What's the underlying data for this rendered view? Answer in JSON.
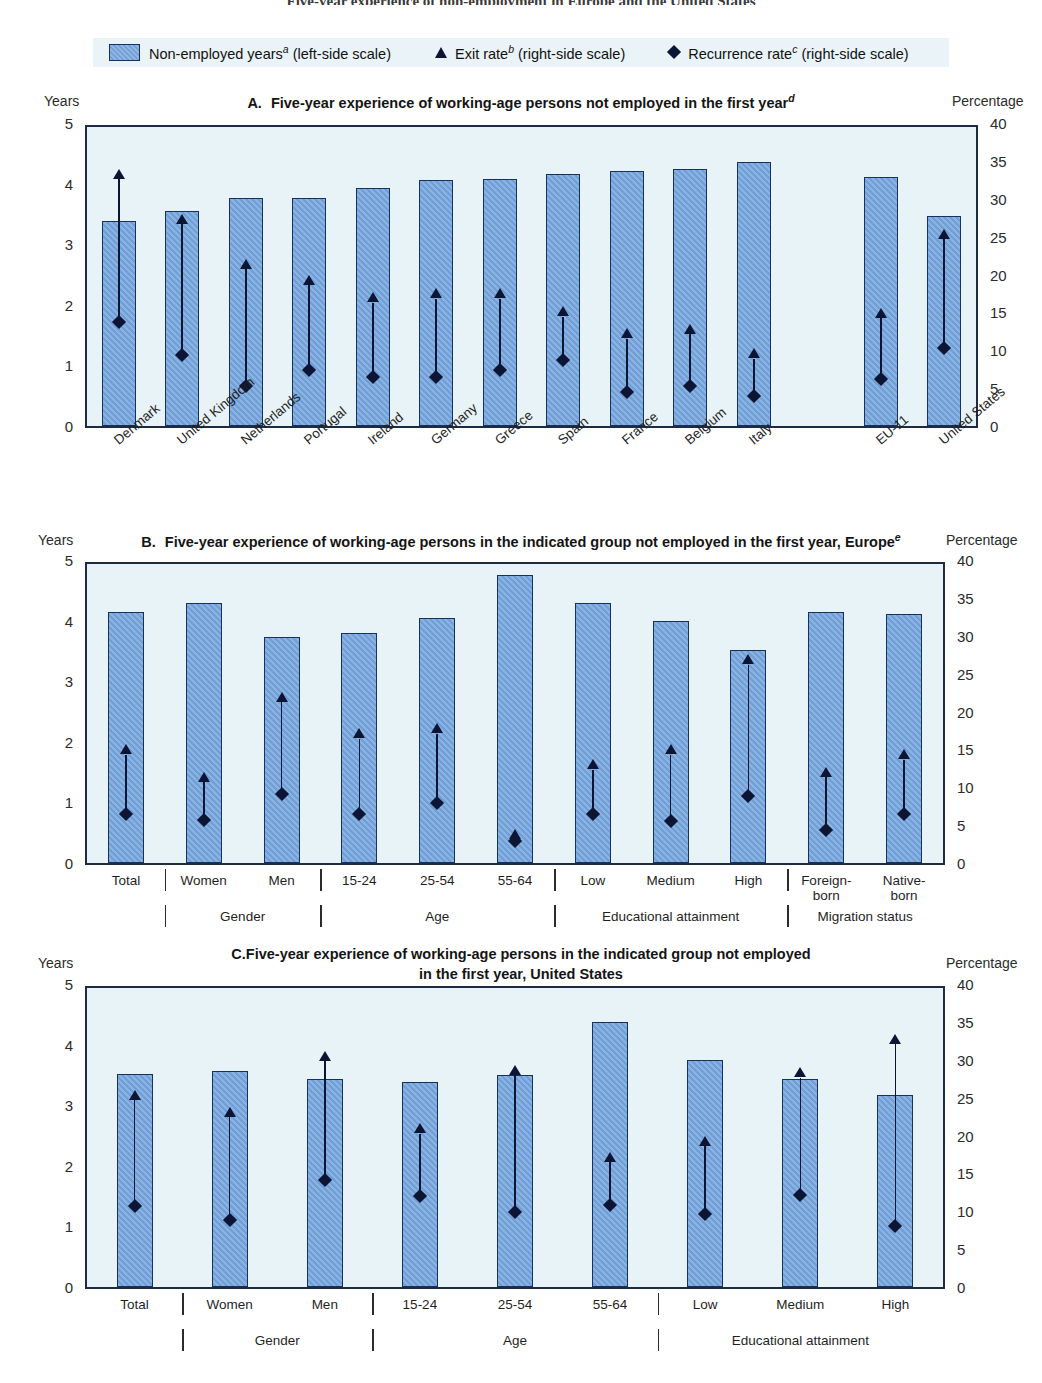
{
  "clipped_top_title": "Five-year experience of non-employment in Europe and the United States",
  "legend": {
    "bar": {
      "label_main": "Non-employed years",
      "sup": "a",
      "label_tail": " (left-side scale)",
      "icon": "bar-swatch"
    },
    "exit": {
      "label_main": "Exit rate",
      "sup": "b",
      "label_tail": " (right-side scale)",
      "icon": "triangle-marker"
    },
    "recurrence": {
      "label_main": "Recurrence rate",
      "sup": "c",
      "label_tail": " (right-side scale)",
      "icon": "diamond-marker"
    }
  },
  "axis": {
    "left_title": "Years",
    "right_title": "Percentage",
    "left_ticks": [
      "5",
      "4",
      "3",
      "2",
      "1",
      "0"
    ],
    "left_values": [
      5,
      4,
      3,
      2,
      1,
      0
    ],
    "right_ticks": [
      "40",
      "35",
      "30",
      "25",
      "20",
      "15",
      "10",
      "5",
      "0"
    ],
    "right_values": [
      40,
      35,
      30,
      25,
      20,
      15,
      10,
      5,
      0
    ]
  },
  "colors": {
    "bar_fill": "#6f9fd8",
    "bar_border": "#16315e",
    "marker": "#0d1535",
    "plot_bg": "#e7f3f7",
    "legend_bg": "#eaf4f8",
    "frame": "#1d2b45"
  },
  "panels": {
    "a": {
      "letter": "A.",
      "title": "Five-year experience of working-age persons not employed in the first year",
      "title_sup": "d"
    },
    "b": {
      "letter": "B.",
      "title": "Five-year experience of working-age persons in the indicated group not employed in the first year, Europe",
      "title_sup": "e"
    },
    "c": {
      "letter": "C.",
      "title_line1": "Five-year experience of working-age persons in the indicated group not employed",
      "title_line2": "in the first year, United States"
    }
  },
  "chart_data": [
    {
      "id": "panel-a",
      "type": "bar",
      "title": "A. Five-year experience of working-age persons not employed in the first year",
      "xlabel": "",
      "ylabel": "Years",
      "y2label": "Percentage",
      "ylim": [
        0,
        5
      ],
      "y2lim": [
        0,
        40
      ],
      "grid": false,
      "legend_position": "top",
      "categories": [
        "Denmark",
        "United Kingdom",
        "Netherlands",
        "Portugal",
        "Ireland",
        "Germany",
        "Greece",
        "Spain",
        "France",
        "Belgium",
        "Italy",
        "",
        "EU-11",
        "United States"
      ],
      "gap_after_index": 10,
      "series": [
        {
          "name": "Non-employed years",
          "axis": "left",
          "unit": "years",
          "values": [
            3.42,
            3.6,
            3.81,
            3.82,
            3.98,
            4.11,
            4.13,
            4.22,
            4.26,
            4.29,
            4.41,
            null,
            4.16,
            3.51
          ]
        },
        {
          "name": "Exit rate",
          "axis": "right",
          "unit": "percentage",
          "values": [
            33.0,
            27.0,
            21.0,
            18.8,
            16.5,
            17.0,
            17.0,
            14.6,
            11.7,
            12.3,
            9.0,
            null,
            14.4,
            25.0
          ]
        },
        {
          "name": "Recurrence rate",
          "axis": "right",
          "unit": "percentage",
          "values": [
            13.9,
            9.5,
            5.4,
            7.5,
            6.6,
            6.5,
            7.5,
            8.8,
            4.6,
            5.3,
            4.0,
            null,
            6.3,
            10.5
          ]
        }
      ]
    },
    {
      "id": "panel-b",
      "type": "bar",
      "title": "B. Five-year experience of working-age persons in the indicated group not employed in the first year, Europe",
      "xlabel": "",
      "ylabel": "Years",
      "y2label": "Percentage",
      "ylim": [
        0,
        5
      ],
      "y2lim": [
        0,
        40
      ],
      "grid": false,
      "legend_position": "top",
      "categories": [
        "Total",
        "Women",
        "Men",
        "15-24",
        "25-54",
        "55-64",
        "Low",
        "Medium",
        "High",
        "Foreign-born",
        "Native-born"
      ],
      "category_groups": [
        {
          "label": "",
          "members": [
            "Total"
          ]
        },
        {
          "label": "Gender",
          "members": [
            "Women",
            "Men"
          ]
        },
        {
          "label": "Age",
          "members": [
            "15-24",
            "25-54",
            "55-64"
          ]
        },
        {
          "label": "Educational attainment",
          "members": [
            "Low",
            "Medium",
            "High"
          ]
        },
        {
          "label": "Migration status",
          "members": [
            "Foreign-born",
            "Native-born"
          ]
        }
      ],
      "series": [
        {
          "name": "Non-employed years",
          "axis": "left",
          "unit": "years",
          "values": [
            4.19,
            4.35,
            3.78,
            3.84,
            4.1,
            4.82,
            4.35,
            4.04,
            3.57,
            4.2,
            4.17
          ]
        },
        {
          "name": "Exit rate",
          "axis": "right",
          "unit": "percentage",
          "values": [
            14.5,
            10.8,
            21.5,
            16.6,
            17.3,
            3.2,
            12.5,
            14.5,
            26.5,
            11.5,
            13.8
          ]
        },
        {
          "name": "Recurrence rate",
          "axis": "right",
          "unit": "percentage",
          "values": [
            6.6,
            5.8,
            9.2,
            6.6,
            8.0,
            3.0,
            6.5,
            5.6,
            9.0,
            4.4,
            6.5
          ]
        }
      ]
    },
    {
      "id": "panel-c",
      "type": "bar",
      "title": "C. Five-year experience of working-age persons in the indicated group not employed in the first year, United States",
      "xlabel": "",
      "ylabel": "Years",
      "y2label": "Percentage",
      "ylim": [
        0,
        5
      ],
      "y2lim": [
        0,
        40
      ],
      "grid": false,
      "legend_position": "top",
      "categories": [
        "Total",
        "Women",
        "Men",
        "15-24",
        "25-54",
        "55-64",
        "Low",
        "Medium",
        "High"
      ],
      "category_groups": [
        {
          "label": "",
          "members": [
            "Total"
          ]
        },
        {
          "label": "Gender",
          "members": [
            "Women",
            "Men"
          ]
        },
        {
          "label": "Age",
          "members": [
            "15-24",
            "25-54",
            "55-64"
          ]
        },
        {
          "label": "Educational attainment",
          "members": [
            "Low",
            "Medium",
            "High"
          ]
        }
      ],
      "series": [
        {
          "name": "Non-employed years",
          "axis": "left",
          "unit": "years",
          "values": [
            3.57,
            3.61,
            3.47,
            3.42,
            3.54,
            4.43,
            3.79,
            3.48,
            3.21
          ]
        },
        {
          "name": "Exit rate",
          "axis": "right",
          "unit": "percentage",
          "values": [
            25.0,
            22.7,
            30.2,
            20.5,
            28.3,
            16.7,
            18.8,
            28.0,
            32.5
          ]
        },
        {
          "name": "Recurrence rate",
          "axis": "right",
          "unit": "percentage",
          "values": [
            10.8,
            9.0,
            14.3,
            12.2,
            10.0,
            11.0,
            9.7,
            12.3,
            8.2
          ]
        }
      ]
    }
  ]
}
